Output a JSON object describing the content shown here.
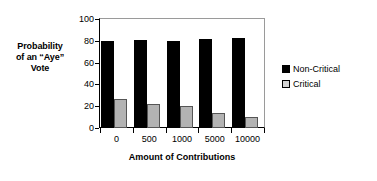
{
  "chart_data": {
    "type": "bar",
    "title": "",
    "subtitle": "",
    "xlabel": "Amount of Contributions",
    "ylabel": "Probability of an \"Aye\" Vote",
    "ylabel_lines": [
      "Probability",
      "of an “Aye”",
      "Vote"
    ],
    "categories": [
      "0",
      "500",
      "1000",
      "5000",
      "10000"
    ],
    "series": [
      {
        "name": "Non-Critical",
        "color": "#000000",
        "values": [
          80,
          81,
          80,
          82,
          83
        ]
      },
      {
        "name": "Critical",
        "color": "#b3b3b3",
        "values": [
          27,
          22,
          20,
          14,
          10
        ]
      }
    ],
    "ylim": [
      0,
      100
    ],
    "yticks": [
      0,
      20,
      40,
      60,
      80,
      100
    ],
    "ytick_labels": [
      "0",
      "20",
      "40",
      "60",
      "80",
      "100"
    ],
    "grid": false,
    "legend_position": "right",
    "bar_group_layout": "left-aligned-pairs"
  },
  "legend": {
    "entries": [
      {
        "label": "Non-Critical",
        "swatch": "black-square-swatch"
      },
      {
        "label": "Critical",
        "swatch": "gray-square-swatch"
      }
    ]
  }
}
